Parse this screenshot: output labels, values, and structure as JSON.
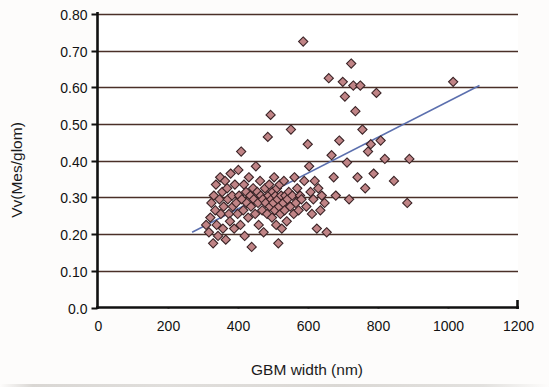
{
  "chart_data": {
    "type": "scatter",
    "title": "",
    "xlabel": "GBM width (nm)",
    "ylabel": "Vv(Mes/glom)",
    "xlim": [
      0,
      1200
    ],
    "ylim": [
      0.0,
      0.8
    ],
    "xticks": [
      "0",
      "200",
      "400",
      "600",
      "800",
      "1000",
      "1200"
    ],
    "xtick_values": [
      0,
      200,
      400,
      600,
      800,
      1000,
      1200
    ],
    "yticks": [
      "0.0",
      "0.10",
      "0.20",
      "0.30",
      "0.40",
      "0.50",
      "0.60",
      "0.70",
      "0.80"
    ],
    "ytick_values": [
      0.0,
      0.1,
      0.2,
      0.3,
      0.4,
      0.5,
      0.6,
      0.7,
      0.8
    ],
    "grid": "horizontal",
    "legend": "none",
    "marker": "diamond",
    "marker_fill": "#c08486",
    "marker_edge": "#3a2326",
    "gridline_color": "#4a3028",
    "axis_color": "#111111",
    "trendline": {
      "color": "#5b6fae",
      "x": [
        270,
        1090
      ],
      "y": [
        0.205,
        0.605
      ]
    },
    "points": [
      [
        310,
        0.225
      ],
      [
        318,
        0.205
      ],
      [
        322,
        0.245
      ],
      [
        325,
        0.285
      ],
      [
        330,
        0.175
      ],
      [
        332,
        0.305
      ],
      [
        336,
        0.265
      ],
      [
        338,
        0.335
      ],
      [
        340,
        0.225
      ],
      [
        344,
        0.195
      ],
      [
        348,
        0.295
      ],
      [
        350,
        0.355
      ],
      [
        352,
        0.255
      ],
      [
        356,
        0.315
      ],
      [
        358,
        0.215
      ],
      [
        360,
        0.275
      ],
      [
        364,
        0.345
      ],
      [
        366,
        0.185
      ],
      [
        370,
        0.325
      ],
      [
        372,
        0.295
      ],
      [
        375,
        0.255
      ],
      [
        378,
        0.235
      ],
      [
        380,
        0.365
      ],
      [
        384,
        0.305
      ],
      [
        386,
        0.275
      ],
      [
        390,
        0.215
      ],
      [
        392,
        0.335
      ],
      [
        396,
        0.285
      ],
      [
        400,
        0.255
      ],
      [
        402,
        0.375
      ],
      [
        404,
        0.305
      ],
      [
        408,
        0.225
      ],
      [
        410,
        0.425
      ],
      [
        412,
        0.295
      ],
      [
        416,
        0.265
      ],
      [
        418,
        0.335
      ],
      [
        420,
        0.195
      ],
      [
        424,
        0.315
      ],
      [
        426,
        0.285
      ],
      [
        430,
        0.245
      ],
      [
        432,
        0.355
      ],
      [
        436,
        0.305
      ],
      [
        438,
        0.275
      ],
      [
        440,
        0.165
      ],
      [
        444,
        0.325
      ],
      [
        446,
        0.295
      ],
      [
        450,
        0.255
      ],
      [
        452,
        0.385
      ],
      [
        456,
        0.315
      ],
      [
        458,
        0.285
      ],
      [
        460,
        0.225
      ],
      [
        464,
        0.345
      ],
      [
        466,
        0.305
      ],
      [
        470,
        0.265
      ],
      [
        472,
        0.295
      ],
      [
        474,
        0.205
      ],
      [
        478,
        0.325
      ],
      [
        480,
        0.285
      ],
      [
        484,
        0.255
      ],
      [
        486,
        0.465
      ],
      [
        488,
        0.305
      ],
      [
        490,
        0.335
      ],
      [
        492,
        0.275
      ],
      [
        494,
        0.525
      ],
      [
        496,
        0.295
      ],
      [
        498,
        0.245
      ],
      [
        500,
        0.315
      ],
      [
        502,
        0.285
      ],
      [
        504,
        0.355
      ],
      [
        506,
        0.265
      ],
      [
        508,
        0.305
      ],
      [
        510,
        0.225
      ],
      [
        512,
        0.325
      ],
      [
        514,
        0.295
      ],
      [
        516,
        0.175
      ],
      [
        518,
        0.275
      ],
      [
        520,
        0.335
      ],
      [
        522,
        0.255
      ],
      [
        524,
        0.305
      ],
      [
        526,
        0.215
      ],
      [
        530,
        0.285
      ],
      [
        532,
        0.345
      ],
      [
        534,
        0.265
      ],
      [
        536,
        0.305
      ],
      [
        540,
        0.235
      ],
      [
        542,
        0.295
      ],
      [
        546,
        0.315
      ],
      [
        550,
        0.275
      ],
      [
        552,
        0.485
      ],
      [
        556,
        0.305
      ],
      [
        560,
        0.255
      ],
      [
        562,
        0.355
      ],
      [
        566,
        0.285
      ],
      [
        570,
        0.325
      ],
      [
        574,
        0.265
      ],
      [
        578,
        0.305
      ],
      [
        582,
        0.295
      ],
      [
        587,
        0.725
      ],
      [
        590,
        0.345
      ],
      [
        596,
        0.275
      ],
      [
        600,
        0.445
      ],
      [
        604,
        0.385
      ],
      [
        608,
        0.315
      ],
      [
        612,
        0.255
      ],
      [
        616,
        0.295
      ],
      [
        620,
        0.345
      ],
      [
        626,
        0.215
      ],
      [
        630,
        0.325
      ],
      [
        636,
        0.265
      ],
      [
        640,
        0.305
      ],
      [
        648,
        0.285
      ],
      [
        654,
        0.205
      ],
      [
        660,
        0.625
      ],
      [
        668,
        0.415
      ],
      [
        674,
        0.355
      ],
      [
        680,
        0.305
      ],
      [
        690,
        0.455
      ],
      [
        700,
        0.615
      ],
      [
        706,
        0.575
      ],
      [
        712,
        0.395
      ],
      [
        718,
        0.295
      ],
      [
        724,
        0.665
      ],
      [
        730,
        0.605
      ],
      [
        736,
        0.535
      ],
      [
        742,
        0.355
      ],
      [
        750,
        0.605
      ],
      [
        756,
        0.485
      ],
      [
        764,
        0.325
      ],
      [
        772,
        0.425
      ],
      [
        780,
        0.445
      ],
      [
        788,
        0.365
      ],
      [
        796,
        0.585
      ],
      [
        808,
        0.455
      ],
      [
        820,
        0.405
      ],
      [
        846,
        0.345
      ],
      [
        884,
        0.285
      ],
      [
        890,
        0.405
      ],
      [
        1015,
        0.615
      ]
    ]
  }
}
